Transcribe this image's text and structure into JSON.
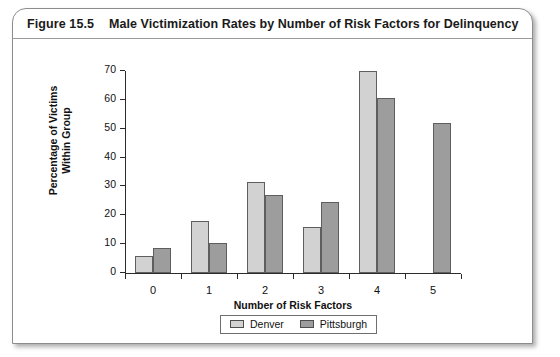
{
  "figure": {
    "number": "Figure 15.5",
    "title": "Male Victimization Rates by Number of Risk Factors for Delinquency"
  },
  "chart_data": {
    "type": "bar",
    "title": "Male Victimization Rates by Number of Risk Factors for Delinquency",
    "xlabel": "Number of Risk Factors",
    "ylabel_line1": "Percentage of Victims",
    "ylabel_line2": "Within Group",
    "categories": [
      "0",
      "1",
      "2",
      "3",
      "4",
      "5"
    ],
    "series": [
      {
        "name": "Denver",
        "color": "#d2d2d2",
        "values": [
          6,
          18,
          31.5,
          16,
          70,
          null
        ]
      },
      {
        "name": "Pittsburgh",
        "color": "#9d9d9d",
        "values": [
          8.5,
          10.5,
          27,
          24.5,
          60.5,
          52
        ]
      }
    ],
    "ylim": [
      0,
      70
    ],
    "yticks": [
      0,
      10,
      20,
      30,
      40,
      50,
      60,
      70
    ],
    "ytick_labels": [
      "0",
      "10",
      "20",
      "30",
      "40",
      "50",
      "60",
      "70"
    ],
    "grid": false,
    "legend_position": "bottom"
  }
}
